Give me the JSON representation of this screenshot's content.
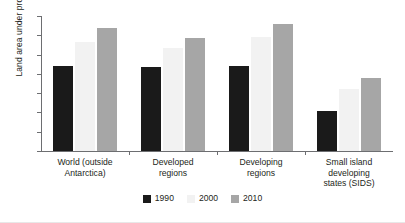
{
  "chart_data": {
    "type": "bar",
    "title": "",
    "subtitle": "",
    "xlabel": "",
    "ylabel": "Land area under protection, (%)",
    "ylim": [
      0,
      14
    ],
    "yticks": [
      0,
      2,
      4,
      6,
      8,
      10,
      12,
      14
    ],
    "grid": false,
    "legend_position": "bottom-center",
    "categories": [
      "World (outside Antarctica)",
      "Developed regions",
      "Developing regions",
      "Small island developing states (SIDS)"
    ],
    "category_lines": [
      [
        "World (outside",
        "Antarctica)"
      ],
      [
        "Developed",
        "regions"
      ],
      [
        "Developing",
        "regions"
      ],
      [
        "Small island",
        "developing",
        "states (SIDS)"
      ]
    ],
    "series": [
      {
        "name": "1990",
        "color": "#1a1a1a",
        "values": [
          8.8,
          8.7,
          8.8,
          4.1
        ]
      },
      {
        "name": "2000",
        "color": "#f2f2f2",
        "values": [
          11.3,
          10.7,
          11.8,
          6.4
        ]
      },
      {
        "name": "2010",
        "color": "#a6a6a6",
        "values": [
          12.8,
          11.7,
          13.2,
          7.6
        ]
      }
    ]
  },
  "legend": {
    "items": [
      {
        "label": "1990",
        "swatch": "legend-swatch-1990"
      },
      {
        "label": "2000",
        "swatch": "legend-swatch-2000"
      },
      {
        "label": "2010",
        "swatch": "legend-swatch-2010"
      }
    ]
  }
}
